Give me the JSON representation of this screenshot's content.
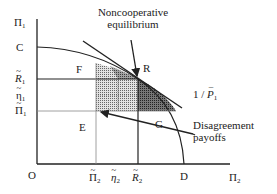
{
  "diagram": {
    "axes": {
      "y_label": "Π",
      "y_sub": "1",
      "x_label": "Π",
      "x_sub": "2",
      "origin": "O"
    },
    "y_ticks": [
      {
        "sym": "C",
        "sub": "",
        "mark": "none"
      },
      {
        "sym": "R",
        "sub": "1",
        "mark": "tilde"
      },
      {
        "sym": "η",
        "sub": "1",
        "mark": "tilde"
      },
      {
        "sym": "Π",
        "sub": "1",
        "mark": "tilde"
      }
    ],
    "x_ticks": [
      {
        "sym": "Π",
        "sub": "2",
        "mark": "tilde"
      },
      {
        "sym": "η",
        "sub": "2",
        "mark": "tilde"
      },
      {
        "sym": "R",
        "sub": "2",
        "mark": "tilde"
      },
      {
        "sym": "D",
        "sub": "",
        "mark": "none"
      }
    ],
    "regions": {
      "F": "F",
      "E": "E",
      "G": "G",
      "R": "R"
    },
    "tangent_label": {
      "prefix": "1 / ",
      "sym": "P",
      "sub": "1"
    },
    "annotations": {
      "noncooperative_line1": "Noncooperative",
      "noncooperative_line2": "equilibrium",
      "disagreement_line1": "Disagreement",
      "disagreement_line2": "payoffs"
    },
    "colors": {
      "ink": "#222222",
      "shade_light": "#b8b8b8",
      "shade_dark": "#555555",
      "background": "#ffffff"
    }
  }
}
